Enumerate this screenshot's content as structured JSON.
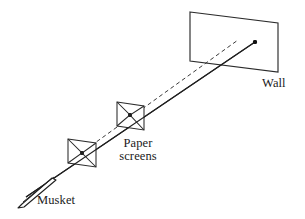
{
  "figure": {
    "type": "physics-diagram",
    "background_color": "#ffffff",
    "stroke_color": "#1a1a1a",
    "labels": {
      "wall": "Wall",
      "paper_line1": "Paper",
      "paper_line2": "screens",
      "musket": "Musket"
    },
    "elements": {
      "wall": {
        "name": "wall",
        "shape": "parallelogram",
        "points": "190,12 278,23 278,72 190,61"
      },
      "screen_near": {
        "name": "paper-screen-near",
        "shape": "bowtie",
        "points": "68,139 96,143 96,167 68,163",
        "notch": "68,139 82,153 68,163",
        "notch2": "96,143 82,153 96,167",
        "hit_x": 82,
        "hit_y": 153
      },
      "screen_far": {
        "name": "paper-screen-far",
        "shape": "bowtie",
        "points": "117,102 144,106 144,130 117,126",
        "notch": "117,102 130,115 117,126",
        "notch2": "144,106 130,115 144,130",
        "hit_x": 130,
        "hit_y": 115
      },
      "trajectory_solid": {
        "name": "bullet-trajectory",
        "style": "solid",
        "from_x": 26,
        "from_y": 197,
        "to_x": 255,
        "to_y": 42
      },
      "trajectory_dashed": {
        "name": "extrapolated-line-of-sight",
        "style": "dashed",
        "from_x": 74,
        "from_y": 158,
        "to_x": 238,
        "to_y": 40,
        "dash_pattern": "4,3"
      },
      "impact_point": {
        "name": "impact-point",
        "x": 255,
        "y": 42,
        "radius": 2.1
      },
      "musket": {
        "name": "musket-barrel",
        "barrel_outline": "18,208 22,204 52,178 56,180 24,207",
        "muzzle_line_from_x": 22,
        "muzzle_line_from_y": 203,
        "muzzle_line_to_x": 55,
        "muzzle_line_to_y": 177
      }
    }
  }
}
